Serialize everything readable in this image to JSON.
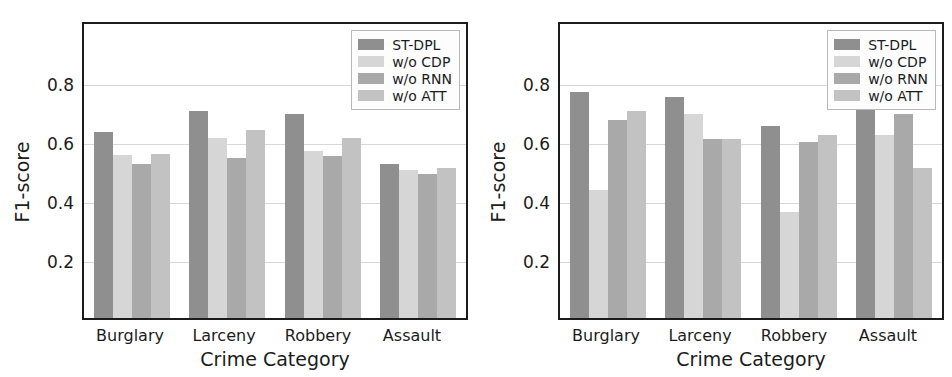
{
  "figure": {
    "panels": [
      "left",
      "right"
    ],
    "colors": {
      "ST-DPL": "#8f8f8f",
      "w/o CDP": "#d6d6d6",
      "w/o RNN": "#a9a9a9",
      "w/o ATT": "#c2c2c2",
      "axis": "#1c1c1c",
      "grid": "#d8d8d8",
      "background": "#ffffff"
    }
  },
  "chart_data": [
    {
      "type": "bar",
      "panel": "left",
      "title": "",
      "xlabel": "Crime Category",
      "ylabel": "F1-score",
      "categories": [
        "Burglary",
        "Larceny",
        "Robbery",
        "Assault"
      ],
      "ylim": [
        0,
        1.01
      ],
      "yticks": [
        0.2,
        0.4,
        0.6,
        0.8
      ],
      "ytick_labels": [
        "0.2",
        "0.4",
        "0.6",
        "0.8"
      ],
      "grid": true,
      "legend_position": "upper right",
      "series": [
        {
          "name": "ST-DPL",
          "color": "#8f8f8f",
          "values": [
            0.64,
            0.71,
            0.7,
            0.53
          ]
        },
        {
          "name": "w/o CDP",
          "color": "#d6d6d6",
          "values": [
            0.56,
            0.62,
            0.575,
            0.51
          ]
        },
        {
          "name": "w/o RNN",
          "color": "#a9a9a9",
          "values": [
            0.53,
            0.55,
            0.555,
            0.495
          ]
        },
        {
          "name": "w/o ATT",
          "color": "#c2c2c2",
          "values": [
            0.565,
            0.645,
            0.62,
            0.515
          ]
        }
      ]
    },
    {
      "type": "bar",
      "panel": "right",
      "title": "",
      "xlabel": "Crime Category",
      "ylabel": "F1-score",
      "categories": [
        "Burglary",
        "Larceny",
        "Robbery",
        "Assault"
      ],
      "ylim": [
        0,
        1.01
      ],
      "yticks": [
        0.2,
        0.4,
        0.6,
        0.8
      ],
      "ytick_labels": [
        "0.2",
        "0.4",
        "0.6",
        "0.8"
      ],
      "grid": true,
      "legend_position": "upper right",
      "series": [
        {
          "name": "ST-DPL",
          "color": "#8f8f8f",
          "values": [
            0.775,
            0.76,
            0.66,
            0.74
          ]
        },
        {
          "name": "w/o CDP",
          "color": "#d6d6d6",
          "values": [
            0.44,
            0.7,
            0.365,
            0.63
          ]
        },
        {
          "name": "w/o RNN",
          "color": "#a9a9a9",
          "values": [
            0.68,
            0.615,
            0.605,
            0.7
          ]
        },
        {
          "name": "w/o ATT",
          "color": "#c2c2c2",
          "values": [
            0.71,
            0.615,
            0.63,
            0.515
          ]
        }
      ]
    }
  ]
}
